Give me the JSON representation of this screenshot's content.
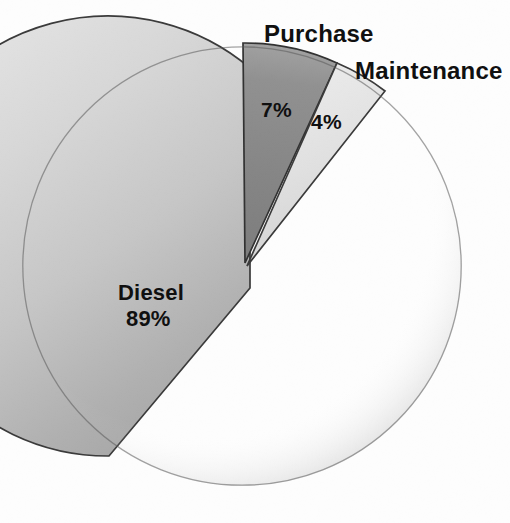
{
  "chart_data": {
    "type": "pie",
    "title": "",
    "categories": [
      "Diesel",
      "Purchase",
      "Maintenance"
    ],
    "values": [
      89,
      7,
      4
    ],
    "value_labels": [
      "89%",
      "7%",
      "4%"
    ],
    "unit": "%",
    "total": 100,
    "legend": "none",
    "labels_position": "inside-and-callout",
    "slices": [
      {
        "name": "Diesel",
        "value": 89,
        "value_label": "89%",
        "color": "#c9c9c9",
        "label_placement": "inside",
        "exploded": true,
        "start_angle_deg": 140.4,
        "end_angle_deg": 360.0
      },
      {
        "name": "Purchase",
        "value": 7,
        "value_label": "7%",
        "color": "#8b8b8b",
        "label_placement": "callout-top",
        "exploded": false,
        "start_angle_deg": 0.0,
        "end_angle_deg": 25.2
      },
      {
        "name": "Maintenance",
        "value": 4,
        "value_label": "4%",
        "color": "#dedede",
        "label_placement": "callout-top-right",
        "exploded": false,
        "start_angle_deg": 25.2,
        "end_angle_deg": 39.6
      }
    ]
  },
  "labels": {
    "purchase_name": "Purchase",
    "purchase_value": "7%",
    "maintenance_name": "Maintenance",
    "maintenance_value": "4%",
    "diesel_name": "Diesel",
    "diesel_value": "89%"
  },
  "colors": {
    "background": "#fdfdfd",
    "text": "#101010",
    "diesel_fill": "#c9c9c9",
    "purchase_fill": "#8b8b8b",
    "maintenance_fill": "#dedede",
    "outline": "#2a2a2a"
  }
}
